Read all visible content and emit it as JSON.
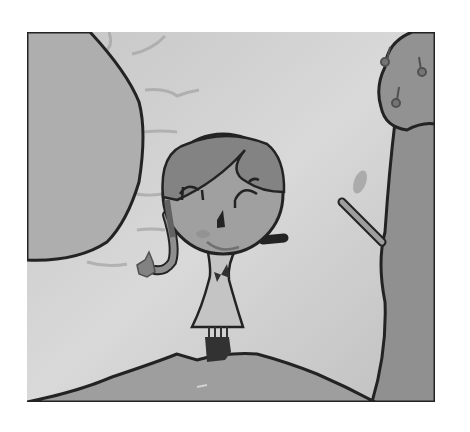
{
  "image": {
    "title": "Child's drawing of a smiling girl standing on a hill between a large rock and a tree",
    "style": "grayscale crayon/watercolor drawing",
    "colors": {
      "background": "#ffffff",
      "sky": "#c9c9c9",
      "sky_light": "#d9d9d9",
      "rock": "#a9a9a9",
      "hill": "#9a9a9a",
      "tree_canopy": "#8e8e8e",
      "tree_trunk": "#8a8a8a",
      "hair": "#7e7e7e",
      "face": "#9c9c9c",
      "dress": "#c2c2c2",
      "outline": "#1a1a1a",
      "boots": "#2a2a2a"
    },
    "elements": [
      "large-rock-left",
      "tree-right-with-fruit",
      "tree-branch-with-leaf",
      "girl-figure",
      "hill-ground"
    ]
  }
}
